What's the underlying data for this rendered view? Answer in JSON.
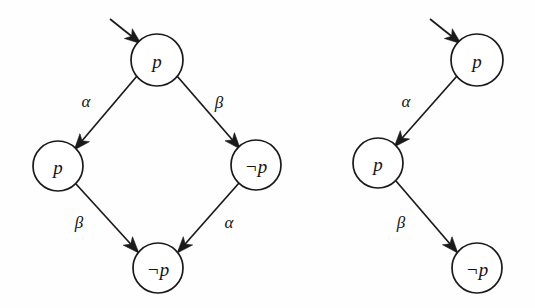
{
  "figure": {
    "background_color": "#fefefe",
    "ink_color": "#1a1a1a",
    "diagram_count": 2
  },
  "diagrams": [
    {
      "id": "left-diagram",
      "name": "diamond-transition-diagram",
      "shape": "diamond",
      "nodes": [
        {
          "id": "L0",
          "label": "p",
          "cx": 157,
          "cy": 60,
          "r": 26,
          "role": "initial-state"
        },
        {
          "id": "L1",
          "label": "p",
          "cx": 58,
          "cy": 166,
          "r": 25,
          "role": "state"
        },
        {
          "id": "L2",
          "label": "¬p",
          "cx": 256,
          "cy": 165,
          "r": 25,
          "role": "state"
        },
        {
          "id": "L3",
          "label": "¬p",
          "cx": 158,
          "cy": 268,
          "r": 25,
          "role": "state"
        }
      ],
      "edges": [
        {
          "from": "L0",
          "to": "L1",
          "label": "α",
          "label_x": 86,
          "label_y": 101
        },
        {
          "from": "L0",
          "to": "L2",
          "label": "β",
          "label_x": 219,
          "label_y": 102
        },
        {
          "from": "L1",
          "to": "L3",
          "label": "β",
          "label_x": 79,
          "label_y": 222
        },
        {
          "from": "L2",
          "to": "L3",
          "label": "α",
          "label_x": 229,
          "label_y": 222
        }
      ],
      "initial_arrow": {
        "x1": 110,
        "y1": 19,
        "x2": 141,
        "y2": 44,
        "target": "L0"
      }
    },
    {
      "id": "right-diagram",
      "name": "path-transition-diagram",
      "shape": "linear-path",
      "nodes": [
        {
          "id": "R0",
          "label": "p",
          "cx": 477,
          "cy": 60,
          "r": 26,
          "role": "initial-state"
        },
        {
          "id": "R1",
          "label": "p",
          "cx": 378,
          "cy": 163,
          "r": 25,
          "role": "state"
        },
        {
          "id": "R2",
          "label": "¬p",
          "cx": 477,
          "cy": 268,
          "r": 25,
          "role": "state"
        }
      ],
      "edges": [
        {
          "from": "R0",
          "to": "R1",
          "label": "α",
          "label_x": 406,
          "label_y": 101
        },
        {
          "from": "R1",
          "to": "R2",
          "label": "β",
          "label_x": 401,
          "label_y": 222
        }
      ],
      "initial_arrow": {
        "x1": 430,
        "y1": 19,
        "x2": 461,
        "y2": 44,
        "target": "R0"
      }
    }
  ],
  "legend": {
    "atoms": [
      "p",
      "¬p"
    ],
    "actions": [
      "α",
      "β"
    ]
  },
  "labels": {
    "left_top_node": "p",
    "left_west_node": "p",
    "left_east_node": "¬p",
    "left_bottom_node": "¬p",
    "left_edge_nw": "α",
    "left_edge_ne": "β",
    "left_edge_sw": "β",
    "left_edge_se": "α",
    "right_top_node": "p",
    "right_mid_node": "p",
    "right_bottom_node": "¬p",
    "right_edge_upper": "α",
    "right_edge_lower": "β"
  }
}
